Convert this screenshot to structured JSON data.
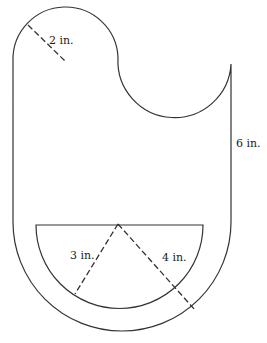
{
  "diagram": {
    "labels": {
      "top_radius": "2 in.",
      "right_height": "6 in.",
      "inner_radius": "3 in.",
      "outer_radius": "4 in."
    },
    "colors": {
      "stroke": "#333333",
      "background": "#ffffff"
    }
  }
}
